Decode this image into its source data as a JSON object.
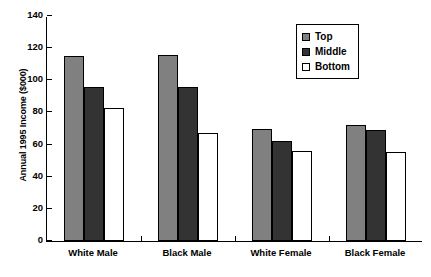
{
  "chart_data": {
    "type": "bar",
    "title": "",
    "xlabel": "",
    "ylabel": "Annual 1995 Income ($000)",
    "ylim": [
      0,
      140
    ],
    "yticks": [
      0,
      20,
      40,
      60,
      80,
      100,
      120,
      140
    ],
    "grid": false,
    "legend_position": "upper right",
    "categories": [
      "White Male",
      "Black Male",
      "White Female",
      "Black Female"
    ],
    "series": [
      {
        "name": "Top",
        "color": "#808080",
        "values": [
          115,
          115.5,
          70,
          72
        ]
      },
      {
        "name": "Middle",
        "color": "#333333",
        "values": [
          96,
          96,
          62,
          69
        ]
      },
      {
        "name": "Bottom",
        "color": "#ffffff",
        "values": [
          83,
          67.5,
          56,
          55.5
        ]
      }
    ]
  },
  "legend": {
    "items": [
      {
        "label": "Top"
      },
      {
        "label": "Middle"
      },
      {
        "label": "Bottom"
      }
    ]
  }
}
